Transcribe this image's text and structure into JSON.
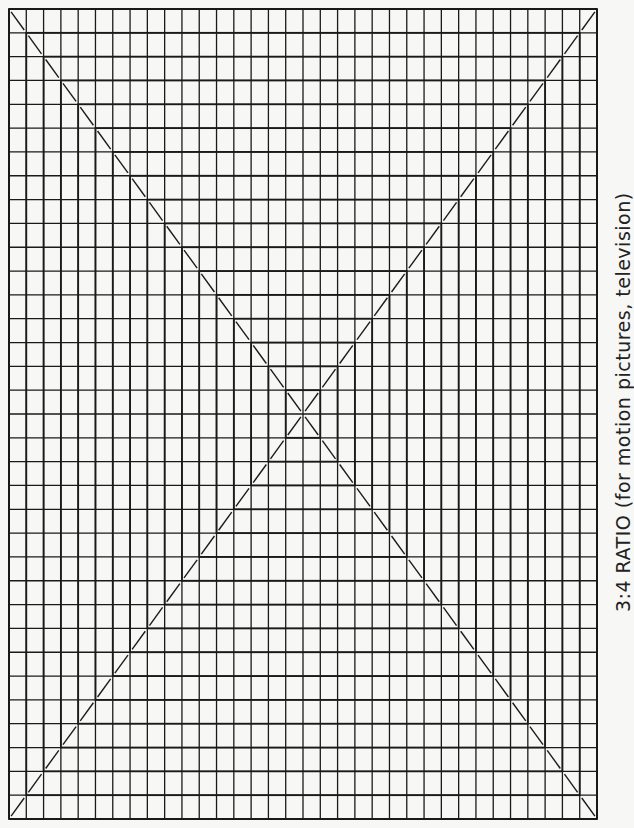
{
  "caption": "3:4 RATIO (for motion pictures, television)",
  "grid": {
    "columns": 34,
    "rows": 34,
    "left": 9,
    "top": 9,
    "right": 597,
    "bottom": 819,
    "line_color": "#1a1a1a",
    "background": "#f7f7f5"
  },
  "nested_rectangles": 17,
  "diagonals": [
    "top-left to bottom-right",
    "top-right to bottom-left"
  ]
}
